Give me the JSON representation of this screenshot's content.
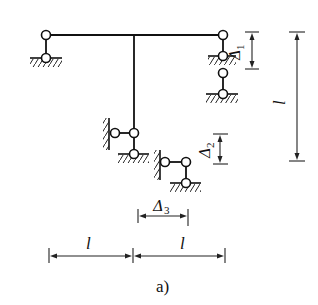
{
  "figure": {
    "caption": "a)"
  },
  "structure": {
    "top_beam": {
      "from": [
        46,
        35
      ],
      "to": [
        223,
        35
      ]
    },
    "stem": {
      "from": [
        134,
        35
      ],
      "to": [
        134,
        133
      ]
    },
    "supports": [
      {
        "id": "left-link-support",
        "type": "vertical link",
        "top_hinge": [
          46,
          35
        ],
        "bottom_hinge": [
          46,
          58
        ]
      },
      {
        "id": "right-upper-link-support",
        "type": "vertical link (settled by Δ1)",
        "top_hinge": [
          223,
          35
        ],
        "bottom_hinge": [
          223,
          56
        ]
      },
      {
        "id": "right-lower-link-support",
        "type": "vertical link (original position)",
        "top_hinge": [
          223,
          73
        ],
        "bottom_hinge": [
          223,
          94
        ]
      },
      {
        "id": "stem-support",
        "type": "hinge with horizontal and vertical links",
        "hinges": [
          [
            115,
            133
          ],
          [
            134,
            133
          ],
          [
            134,
            154
          ]
        ]
      },
      {
        "id": "displaced-stem-support",
        "type": "support after Δ2 and Δ3 shifts",
        "hinges": [
          [
            165,
            162
          ],
          [
            186,
            162
          ],
          [
            186,
            183
          ]
        ]
      }
    ]
  },
  "dimensions": {
    "delta1": {
      "symbol": "Δ",
      "subscript": "1",
      "direction": "vertical"
    },
    "delta2": {
      "symbol": "Δ",
      "subscript": "2",
      "direction": "vertical"
    },
    "delta3": {
      "symbol": "Δ",
      "subscript": "3",
      "direction": "horizontal"
    },
    "height": {
      "label": "l",
      "direction": "vertical"
    },
    "left_span": {
      "label": "l",
      "direction": "horizontal"
    },
    "right_span": {
      "label": "l",
      "direction": "horizontal"
    }
  }
}
